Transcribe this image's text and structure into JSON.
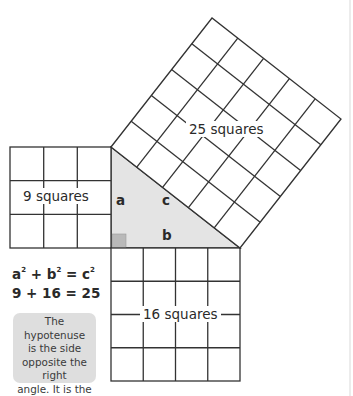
{
  "diagram": {
    "colors": {
      "stroke": "#333333",
      "triangle_fill": "#e4e4e4",
      "right_angle_marker": "#b9b9b9",
      "callout_bg": "#dedede",
      "text": "#2a2a2a"
    },
    "squares": [
      {
        "id": "a-square",
        "label": "9 squares",
        "grid": 3,
        "count": 9
      },
      {
        "id": "b-square",
        "label": "16 squares",
        "grid": 4,
        "count": 16
      },
      {
        "id": "c-square",
        "label": "25 squares",
        "grid": 5,
        "count": 25
      }
    ],
    "triangle": {
      "side_a": "a",
      "side_b": "b",
      "side_c": "c"
    },
    "formula": {
      "general": {
        "a": "a",
        "b": "b",
        "c": "c",
        "exp": "2",
        "plus": " + ",
        "equals": " = "
      },
      "numeric": "9 + 16 = 25"
    },
    "callout": {
      "text": "The hypotenuse is the side opposite the right angle. It is the longest side.",
      "lines": [
        "The hypotenuse",
        "is the side",
        "opposite the right",
        "angle. It is the",
        "longest side."
      ]
    }
  }
}
